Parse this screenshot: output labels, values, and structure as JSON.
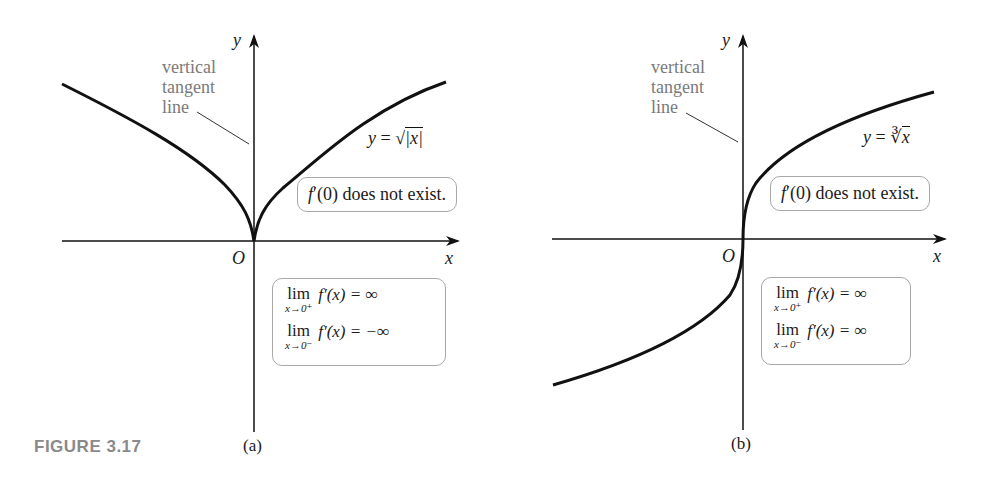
{
  "figure": {
    "label": "FIGURE 3.17",
    "panels": [
      {
        "id": "a",
        "caption": "(a)",
        "axis_x_label": "x",
        "axis_y_label": "y",
        "origin_label": "O",
        "annotation_lines": [
          "vertical",
          "tangent",
          "line"
        ],
        "function_label": "y = √|x|",
        "function_prefix": "y = ",
        "function_radical": "√",
        "function_radicand": "|x|",
        "statement_f": "f",
        "statement_rest": "′(0) does not exist.",
        "limits": [
          {
            "lim": "lim",
            "sub": "x→0⁺",
            "expr": "f′(x) = ∞"
          },
          {
            "lim": "lim",
            "sub": "x→0⁻",
            "expr": "f′(x) = −∞"
          }
        ]
      },
      {
        "id": "b",
        "caption": "(b)",
        "axis_x_label": "x",
        "axis_y_label": "y",
        "origin_label": "O",
        "annotation_lines": [
          "vertical",
          "tangent",
          "line"
        ],
        "function_label": "y = ∛x",
        "function_prefix": "y = ",
        "function_radical": "∛",
        "function_radicand": "x",
        "statement_f": "f",
        "statement_rest": "′(0) does not exist.",
        "limits": [
          {
            "lim": "lim",
            "sub": "x→0⁺",
            "expr": "f′(x) = ∞"
          },
          {
            "lim": "lim",
            "sub": "x→0⁻",
            "expr": "f′(x) = ∞"
          }
        ]
      }
    ]
  },
  "colors": {
    "curve": "#111111",
    "axis": "#111111",
    "annotation_text": "#7a7a7a",
    "box_border": "#a8a8a8",
    "figure_label": "#8a8a8a"
  }
}
